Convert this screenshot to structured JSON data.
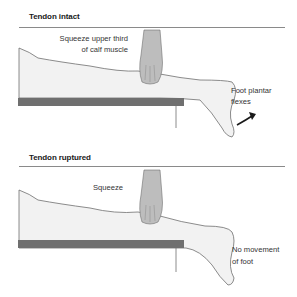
{
  "panels": [
    {
      "title": "Tendon intact",
      "squeeze_label_line1": "Squeeze upper third",
      "squeeze_label_line2": "of calf muscle",
      "result_label_line1": "Foot plantar",
      "result_label_line2": "flexes",
      "foot_movement_arrow": "curved-arrow-icon"
    },
    {
      "title": "Tendon ruptured",
      "squeeze_label_line1": "Squeeze",
      "result_label_line1": "No movement",
      "result_label_line2": "of foot"
    }
  ],
  "colors": {
    "leg_fill": "#f2f2f2",
    "leg_outline": "#6e6e6e",
    "table": "#6f6f6f",
    "hand": "#bdbdbd",
    "text": "#333333"
  }
}
